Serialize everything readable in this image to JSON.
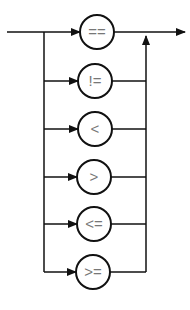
{
  "diagram": {
    "type": "syntax-diagram",
    "operators": [
      {
        "label": "==",
        "y": 32,
        "cx": 97
      },
      {
        "label": "!=",
        "y": 81,
        "cx": 95
      },
      {
        "label": "<",
        "y": 129,
        "cx": 95
      },
      {
        "label": ">",
        "y": 177,
        "cx": 94
      },
      {
        "label": "<=",
        "y": 224,
        "cx": 94
      },
      {
        "label": ">=",
        "y": 272,
        "cx": 93
      }
    ],
    "colors": {
      "line": "#111111",
      "text": "#777777",
      "background": "#ffffff"
    }
  }
}
